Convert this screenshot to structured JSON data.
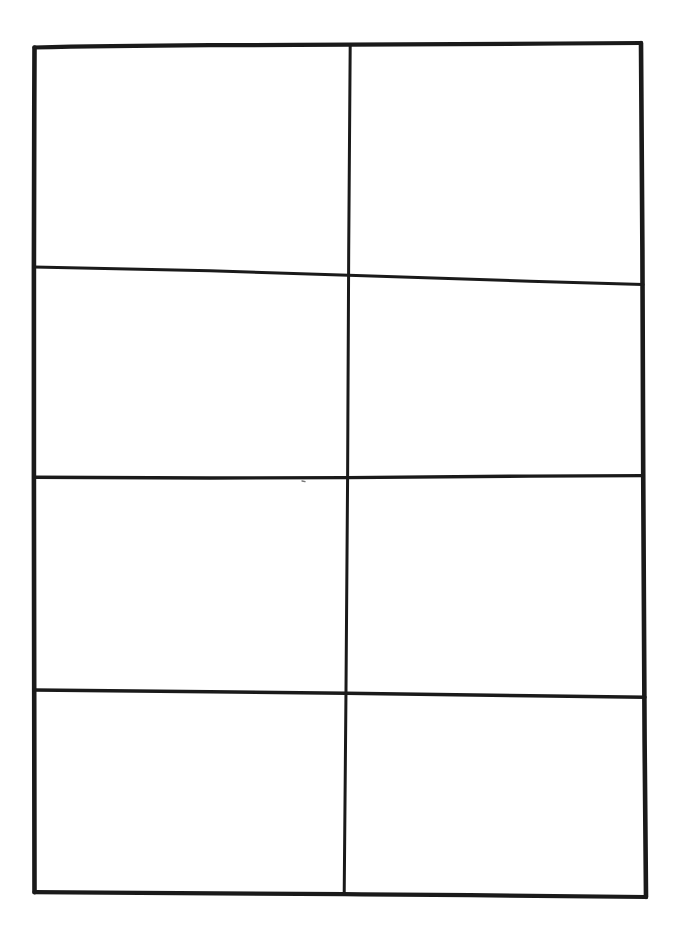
{
  "document": {
    "title": "Blank hand-drawn table",
    "medium": "scanned pen-on-paper line drawing",
    "background_color": "#ffffff",
    "ink_color": "#1a1a1a",
    "canvas": {
      "width": 681,
      "height": 933
    }
  },
  "table": {
    "rows": 4,
    "columns": 2,
    "cell_count": 8,
    "has_header_row": false,
    "all_cells_empty": true,
    "outer_border": {
      "top_left": [
        34,
        47
      ],
      "top_right": [
        641,
        43
      ],
      "bottom_right": [
        646,
        897
      ],
      "bottom_left": [
        34,
        892
      ],
      "stroke_width": 4.5
    },
    "vertical_dividers": [
      {
        "name": "column-divider-1",
        "top": [
          350,
          45
        ],
        "bottom": [
          344,
          895
        ],
        "stroke_width": 3
      }
    ],
    "horizontal_dividers": [
      {
        "name": "row-divider-1",
        "left": [
          34,
          267
        ],
        "right": [
          643,
          285
        ],
        "stroke_width": 3,
        "note": "slanted downward to the right"
      },
      {
        "name": "row-divider-2",
        "left": [
          34,
          477
        ],
        "right": [
          643,
          476
        ],
        "stroke_width": 3.5,
        "note": "nearly level"
      },
      {
        "name": "row-divider-3",
        "left": [
          34,
          690
        ],
        "right": [
          645,
          697
        ],
        "stroke_width": 3.5,
        "note": "slight downward tilt to the right"
      }
    ],
    "cells": [
      {
        "id": "r1c1",
        "row": 1,
        "column": 1,
        "text": "",
        "x": 36,
        "y": 50,
        "width": 312,
        "height": 218
      },
      {
        "id": "r1c2",
        "row": 1,
        "column": 2,
        "text": "",
        "x": 352,
        "y": 48,
        "width": 288,
        "height": 235
      },
      {
        "id": "r2c1",
        "row": 2,
        "column": 1,
        "text": "",
        "x": 36,
        "y": 270,
        "width": 310,
        "height": 206
      },
      {
        "id": "r2c2",
        "row": 2,
        "column": 2,
        "text": "",
        "x": 350,
        "y": 288,
        "width": 291,
        "height": 188
      },
      {
        "id": "r3c1",
        "row": 3,
        "column": 1,
        "text": "",
        "x": 36,
        "y": 480,
        "width": 308,
        "height": 209
      },
      {
        "id": "r3c2",
        "row": 3,
        "column": 2,
        "text": "",
        "x": 348,
        "y": 479,
        "width": 294,
        "height": 217
      },
      {
        "id": "r4c1",
        "row": 4,
        "column": 1,
        "text": "",
        "x": 36,
        "y": 693,
        "width": 307,
        "height": 198
      },
      {
        "id": "r4c2",
        "row": 4,
        "column": 2,
        "text": "",
        "x": 347,
        "y": 700,
        "width": 297,
        "height": 196
      }
    ]
  }
}
